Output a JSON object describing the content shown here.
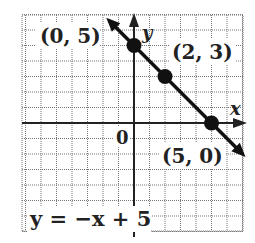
{
  "chart_data": {
    "type": "line",
    "title": "",
    "equation": "y = −x + 5",
    "xlabel": "x",
    "ylabel": "y",
    "origin_label": "0",
    "grid": true,
    "xlim": [
      -7.3,
      7
    ],
    "ylim": [
      -7,
      7
    ],
    "series": [
      {
        "name": "y = −x + 5",
        "slope": -1,
        "intercept": 5,
        "points": [
          {
            "x": 0,
            "y": 5,
            "label": "(0, 5)"
          },
          {
            "x": 2,
            "y": 3,
            "label": "(2, 3)"
          },
          {
            "x": 5,
            "y": 0,
            "label": "(5, 0)"
          }
        ]
      }
    ],
    "colors": {
      "line": "#111111",
      "grid": "#777777",
      "axis": "#222222",
      "background": "#ffffff"
    }
  },
  "labels": {
    "point_0_5": "(0, 5)",
    "point_2_3": "(2, 3)",
    "point_5_0": "(5, 0)",
    "x_axis": "x",
    "y_axis": "y",
    "origin": "0",
    "equation": "y = −x + 5"
  }
}
